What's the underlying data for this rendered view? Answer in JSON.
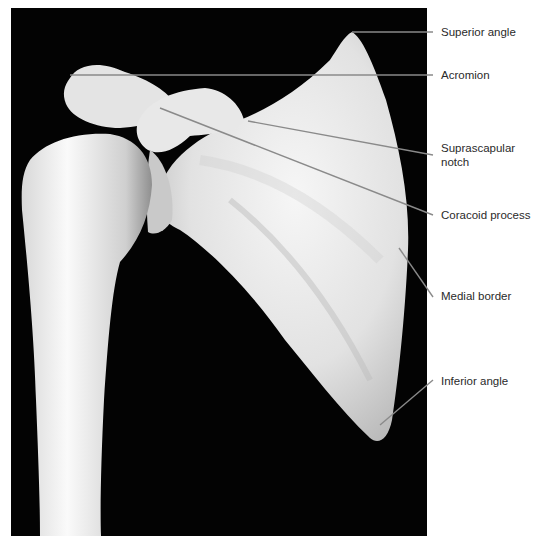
{
  "figure": {
    "background_color": "#030303",
    "bone_color": "#ececec",
    "leader_color": "#8a8a8a",
    "labels": [
      {
        "id": "superior-angle",
        "lines": [
          "Superior angle"
        ],
        "y": 25,
        "line": {
          "x1": 352,
          "y1": 32,
          "x2": 433,
          "y2": 32
        }
      },
      {
        "id": "acromion",
        "lines": [
          "Acromion"
        ],
        "y": 68,
        "line": {
          "x1": 70,
          "y1": 75,
          "x2": 433,
          "y2": 75
        }
      },
      {
        "id": "suprascapular-notch",
        "lines": [
          "Suprascapular",
          "notch"
        ],
        "y": 141,
        "line": {
          "x1": 248,
          "y1": 121,
          "x2": 433,
          "y2": 155
        }
      },
      {
        "id": "coracoid-process",
        "lines": [
          "Coracoid process"
        ],
        "y": 208,
        "line": {
          "x1": 160,
          "y1": 108,
          "x2": 433,
          "y2": 215
        }
      },
      {
        "id": "medial-border",
        "lines": [
          "Medial border"
        ],
        "y": 289,
        "line": {
          "x1": 399,
          "y1": 248,
          "x2": 433,
          "y2": 297
        }
      },
      {
        "id": "inferior-angle",
        "lines": [
          "Inferior angle"
        ],
        "y": 374,
        "line": {
          "x1": 380,
          "y1": 425,
          "x2": 433,
          "y2": 380
        }
      }
    ]
  }
}
